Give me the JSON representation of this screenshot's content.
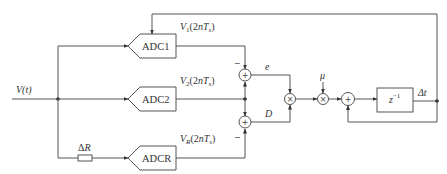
{
  "diagram": {
    "type": "block-diagram",
    "input": {
      "label": "V(t)"
    },
    "resistor": {
      "label": "ΔR"
    },
    "adcs": [
      {
        "id": "adc1",
        "label": "ADC1",
        "output": "V",
        "output_sub": "1",
        "output_arg": "(2nT",
        "output_arg_sub": "s",
        "output_close": ")"
      },
      {
        "id": "adc2",
        "label": "ADC2",
        "output": "V",
        "output_sub": "2",
        "output_arg": "(2nT",
        "output_arg_sub": "s",
        "output_close": ")"
      },
      {
        "id": "adcr",
        "label": "ADCR",
        "output": "V",
        "output_sub": "R",
        "output_arg": "(2nT",
        "output_arg_sub": "s",
        "output_close": ")"
      }
    ],
    "summers": [
      {
        "id": "sum-e",
        "symbol": "+",
        "minus_label": "−"
      },
      {
        "id": "sum-d",
        "symbol": "+",
        "minus_label": "−"
      },
      {
        "id": "sum-acc",
        "symbol": "+"
      }
    ],
    "multipliers": [
      {
        "id": "mult-ed",
        "symbol": "×"
      },
      {
        "id": "mult-mu",
        "symbol": "×"
      }
    ],
    "signals": {
      "e": "e",
      "d": "D",
      "mu": "μ"
    },
    "delay": {
      "label": "z",
      "exponent": "−1"
    },
    "output": {
      "label": "Δt"
    }
  }
}
